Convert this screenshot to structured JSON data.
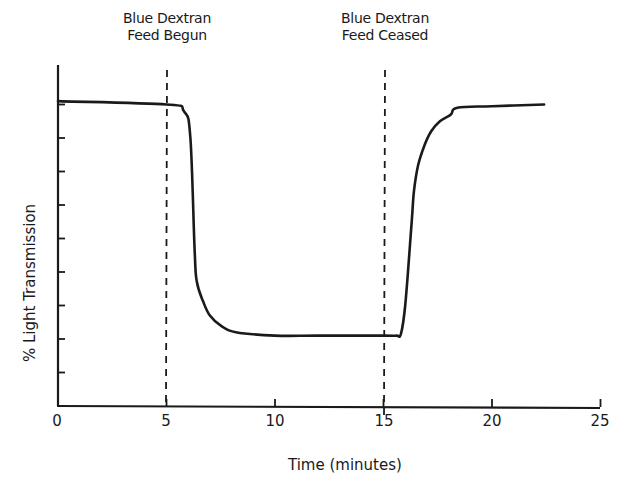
{
  "chart_data": {
    "type": "line",
    "title": "",
    "xlabel": "Time (minutes)",
    "ylabel": "% Light Transmission",
    "xlim": [
      0,
      25
    ],
    "ylim": [
      0,
      100
    ],
    "xticks": [
      0,
      5,
      10,
      15,
      20,
      25
    ],
    "xtick_labels": [
      "0",
      "5",
      "10",
      "15",
      "20",
      "25"
    ],
    "yticks": [
      10,
      20,
      30,
      40,
      50,
      60,
      70,
      80,
      90
    ],
    "ytick_labels": [],
    "grid": false,
    "legend": null,
    "series": [
      {
        "name": "% Light Transmission",
        "x": [
          0,
          5.0,
          5.8,
          6.1,
          6.3,
          6.4,
          6.7,
          7.0,
          7.5,
          8.2,
          10,
          12,
          15,
          15.6,
          15.8,
          16.0,
          16.3,
          16.4,
          16.6,
          16.9,
          17.2,
          17.6,
          18.1,
          18.4,
          20,
          22.4
        ],
        "y": [
          91,
          90,
          88,
          80,
          46,
          37,
          31,
          27,
          24,
          22,
          21,
          21,
          21,
          21,
          21.5,
          30,
          55,
          64,
          72,
          78,
          82,
          85,
          87,
          89,
          89.5,
          90
        ]
      }
    ],
    "annotations": [
      {
        "text": "Blue Dextran\nFeed Begun",
        "x": 5,
        "style": "dashed vertical line"
      },
      {
        "text": "Blue Dextran\nFeed Ceased",
        "x": 15,
        "style": "dashed vertical line"
      }
    ]
  },
  "labels": {
    "xlabel": "Time (minutes)",
    "ylabel": "% Light Transmission",
    "ann1_line1": "Blue Dextran",
    "ann1_line2": "Feed Begun",
    "ann2_line1": "Blue Dextran",
    "ann2_line2": "Feed Ceased",
    "xticks": [
      "0",
      "5",
      "10",
      "15",
      "20",
      "25"
    ]
  },
  "colors": {
    "ink": "#1a1a1a",
    "background": "#ffffff"
  }
}
